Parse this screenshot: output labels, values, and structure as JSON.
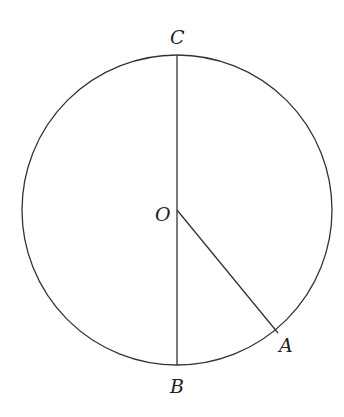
{
  "diagram": {
    "stroke_color": "#333333",
    "circle": {
      "cx": 177,
      "cy": 210,
      "r": 155
    },
    "points": {
      "C": {
        "label": "C",
        "x": 177,
        "y": 55
      },
      "O": {
        "label": "O",
        "x": 177,
        "y": 210
      },
      "B": {
        "label": "B",
        "x": 177,
        "y": 365
      },
      "A": {
        "label": "A",
        "x": 278,
        "y": 333
      }
    },
    "segments": [
      {
        "name": "diameter-CB",
        "from": "C",
        "to": "B"
      },
      {
        "name": "radius-OA",
        "from": "O",
        "to": "A"
      }
    ]
  }
}
